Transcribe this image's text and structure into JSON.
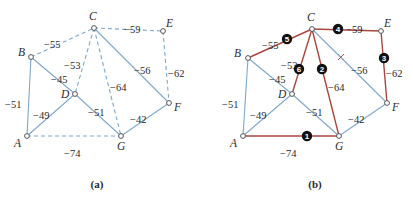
{
  "figure": {
    "colors": {
      "tree_edge": "#a8473f",
      "solid_edge": "#7fa7c9",
      "dashed_edge": "#7fa7c9",
      "node_fill": "#ffffff",
      "node_stroke": "#555555",
      "badge_fill": "#111111",
      "text": "#2b2b2b"
    },
    "panels": [
      {
        "id": "a",
        "caption": "(a)",
        "caption_pos": [
          97,
          184
        ],
        "nodes": [
          {
            "id": "A",
            "x": 27,
            "y": 136,
            "label": "A",
            "lx": 14,
            "ly": 147
          },
          {
            "id": "B",
            "x": 31,
            "y": 57,
            "label": "B",
            "lx": 18,
            "ly": 56
          },
          {
            "id": "C",
            "x": 94,
            "y": 28,
            "label": "C",
            "lx": 89,
            "ly": 20
          },
          {
            "id": "D",
            "x": 75,
            "y": 94,
            "label": "D",
            "lx": 61,
            "ly": 98
          },
          {
            "id": "E",
            "x": 163,
            "y": 31,
            "label": "E",
            "lx": 166,
            "ly": 27
          },
          {
            "id": "F",
            "x": 169,
            "y": 103,
            "label": "F",
            "lx": 174,
            "ly": 111
          },
          {
            "id": "G",
            "x": 121,
            "y": 136,
            "label": "G",
            "lx": 117,
            "ly": 150
          }
        ],
        "edges": [
          {
            "from": "B",
            "to": "C",
            "weight": "−55",
            "style": "dashed",
            "lx": 44,
            "ly": 40
          },
          {
            "from": "C",
            "to": "E",
            "weight": "−59",
            "style": "dashed",
            "lx": 124,
            "ly": 25
          },
          {
            "from": "C",
            "to": "D",
            "weight": "−53",
            "style": "dashed",
            "lx": 64,
            "ly": 61
          },
          {
            "from": "C",
            "to": "G",
            "weight": "−64",
            "style": "dashed",
            "lx": 110,
            "ly": 83
          },
          {
            "from": "C",
            "to": "F",
            "weight": "−56",
            "style": "solid",
            "lx": 134,
            "ly": 66
          },
          {
            "from": "E",
            "to": "F",
            "weight": "−62",
            "style": "dashed",
            "lx": 168,
            "ly": 69
          },
          {
            "from": "B",
            "to": "D",
            "weight": "−45",
            "style": "solid",
            "lx": 51,
            "ly": 75
          },
          {
            "from": "B",
            "to": "A",
            "weight": "−51",
            "style": "solid",
            "lx": 5,
            "ly": 100
          },
          {
            "from": "A",
            "to": "D",
            "weight": "−49",
            "style": "solid",
            "lx": 33,
            "ly": 111
          },
          {
            "from": "D",
            "to": "G",
            "weight": "−51",
            "style": "solid",
            "lx": 88,
            "ly": 108
          },
          {
            "from": "G",
            "to": "F",
            "weight": "−42",
            "style": "solid",
            "lx": 130,
            "ly": 115
          },
          {
            "from": "A",
            "to": "G",
            "weight": "−74",
            "style": "dashed",
            "lx": 64,
            "ly": 149
          }
        ]
      },
      {
        "id": "b",
        "caption": "(b)",
        "caption_pos": [
          315,
          184
        ],
        "nodes": [
          {
            "id": "A",
            "x": 243,
            "y": 136,
            "label": "A",
            "lx": 230,
            "ly": 147
          },
          {
            "id": "B",
            "x": 248,
            "y": 58,
            "label": "B",
            "lx": 234,
            "ly": 57
          },
          {
            "id": "C",
            "x": 312,
            "y": 29,
            "label": "C",
            "lx": 307,
            "ly": 21
          },
          {
            "id": "D",
            "x": 292,
            "y": 94,
            "label": "D",
            "lx": 278,
            "ly": 98
          },
          {
            "id": "E",
            "x": 381,
            "y": 31,
            "label": "E",
            "lx": 384,
            "ly": 27
          },
          {
            "id": "F",
            "x": 387,
            "y": 103,
            "label": "F",
            "lx": 392,
            "ly": 111
          },
          {
            "id": "G",
            "x": 339,
            "y": 136,
            "label": "G",
            "lx": 335,
            "ly": 150
          }
        ],
        "edges": [
          {
            "from": "B",
            "to": "C",
            "weight": "−55",
            "style": "tree",
            "lx": 262,
            "ly": 41,
            "order": "5",
            "bx": 287,
            "by": 39
          },
          {
            "from": "C",
            "to": "E",
            "weight": "−59",
            "style": "tree",
            "lx": 346,
            "ly": 25,
            "order": "4",
            "bx": 338,
            "by": 29
          },
          {
            "from": "C",
            "to": "D",
            "weight": "−53",
            "style": "tree",
            "lx": 281,
            "ly": 61,
            "order": "6",
            "bx": 299,
            "by": 69
          },
          {
            "from": "C",
            "to": "G",
            "weight": "−64",
            "style": "tree",
            "lx": 328,
            "ly": 83,
            "order": "2",
            "bx": 322,
            "by": 69
          },
          {
            "from": "C",
            "to": "F",
            "weight": "−56",
            "style": "solid",
            "lx": 351,
            "ly": 66,
            "cross": [
              341,
              57
            ]
          },
          {
            "from": "E",
            "to": "F",
            "weight": "−62",
            "style": "tree",
            "lx": 386,
            "ly": 69,
            "order": "3",
            "bx": 384,
            "by": 58
          },
          {
            "from": "B",
            "to": "D",
            "weight": "−45",
            "style": "solid",
            "lx": 269,
            "ly": 75
          },
          {
            "from": "B",
            "to": "A",
            "weight": "−51",
            "style": "solid",
            "lx": 222,
            "ly": 100
          },
          {
            "from": "A",
            "to": "D",
            "weight": "−49",
            "style": "solid",
            "lx": 250,
            "ly": 111
          },
          {
            "from": "D",
            "to": "G",
            "weight": "−51",
            "style": "solid",
            "lx": 306,
            "ly": 108
          },
          {
            "from": "G",
            "to": "F",
            "weight": "−42",
            "style": "solid",
            "lx": 348,
            "ly": 115
          },
          {
            "from": "A",
            "to": "G",
            "weight": "−74",
            "style": "tree",
            "lx": 280,
            "ly": 149,
            "order": "1",
            "bx": 307,
            "by": 136
          }
        ]
      }
    ]
  }
}
